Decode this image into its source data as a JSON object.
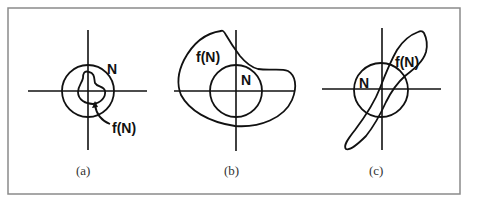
{
  "figure": {
    "panels": [
      {
        "id": "a",
        "caption": "(a)",
        "set_label": "N",
        "image_label": "f(N)",
        "description": "f(N) lies entirely inside N"
      },
      {
        "id": "b",
        "caption": "(b)",
        "set_label": "N",
        "image_label": "f(N)",
        "description": "f(N) contains N"
      },
      {
        "id": "c",
        "caption": "(c)",
        "set_label": "N",
        "image_label": "f(N)",
        "description": "f(N) partially overlaps N, elongated diagonally"
      }
    ]
  },
  "colors": {
    "stroke": "#111111",
    "frame": "#8a8a8a",
    "caption": "#333333"
  }
}
